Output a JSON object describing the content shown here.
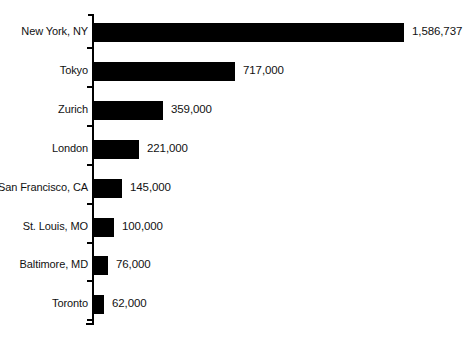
{
  "chart_data": {
    "type": "bar",
    "orientation": "horizontal",
    "title": "",
    "subtitle": "",
    "xlabel": "",
    "ylabel": "",
    "grid": false,
    "legend": false,
    "legend_position": "none",
    "axis_range": [
      0,
      1586737
    ],
    "bar_color": "#000000",
    "background_color": "#ffffff",
    "categories": [
      "New York, NY",
      "Tokyo",
      "Zurich",
      "London",
      "San Francisco, CA",
      "St. Louis, MO",
      "Baltimore, MD",
      "Toronto"
    ],
    "values": [
      1586737,
      717000,
      359000,
      221000,
      145000,
      100000,
      76000,
      62000
    ],
    "value_labels": [
      "1,586,737",
      "717,000",
      "359,000",
      "221,000",
      "145,000",
      "100,000",
      "76,000",
      "62,000"
    ],
    "bar_pixel_widths": [
      310,
      141,
      69,
      45,
      28,
      20,
      14,
      10
    ]
  }
}
